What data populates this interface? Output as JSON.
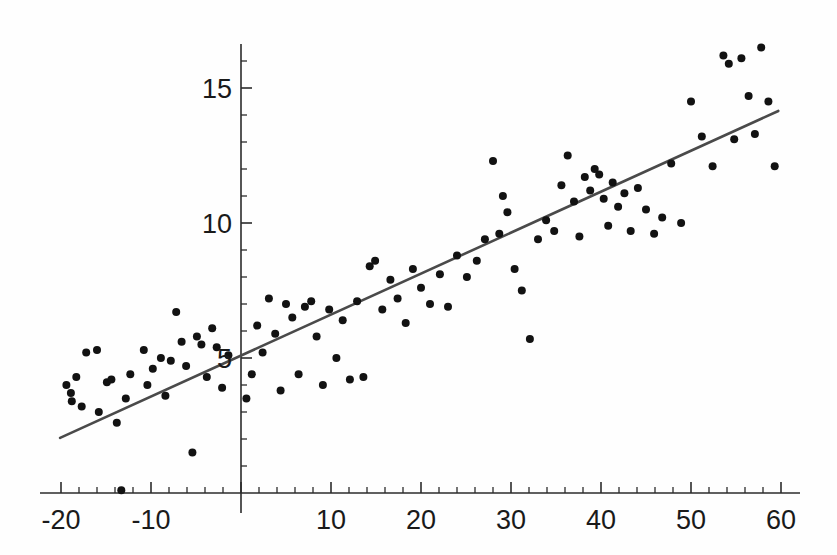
{
  "chart_data": {
    "type": "scatter",
    "title": "",
    "subtitle": "",
    "xlabel": "",
    "ylabel": "",
    "xlim": [
      -21,
      61
    ],
    "ylim": [
      0,
      16.8
    ],
    "grid": false,
    "legend": false,
    "legend_position": "none",
    "x_ticks_major": [
      -20,
      -10,
      0,
      10,
      20,
      30,
      40,
      50,
      60
    ],
    "x_tick_labels": [
      "-20",
      "-10",
      "",
      "10",
      "20",
      "30",
      "40",
      "50",
      "60"
    ],
    "x_tick_minor_step": 2,
    "y_ticks_major": [
      5,
      10,
      15
    ],
    "y_tick_labels": [
      "5",
      "10",
      "15"
    ],
    "y_tick_minor_step": 1,
    "axes_style": "crossed-spines-at-origin",
    "marker": "filled-circle",
    "marker_size_px": 8,
    "point_color": "#121212",
    "line_color": "#4a4a4a",
    "axis_color": "#2b2b2b",
    "background_color": "#fefefe",
    "series": [
      {
        "name": "observations",
        "x": [
          -19.4,
          -18.9,
          -18.8,
          -18.3,
          -17.7,
          -17.2,
          -16.0,
          -15.8,
          -14.9,
          -14.4,
          -13.8,
          -13.3,
          -12.8,
          -12.3,
          -10.8,
          -10.4,
          -9.8,
          -8.9,
          -8.4,
          -7.8,
          -7.2,
          -6.6,
          -6.1,
          -5.4,
          -4.9,
          -4.4,
          -3.8,
          -3.2,
          -2.7,
          -2.1,
          -1.4,
          0.6,
          1.2,
          1.8,
          2.4,
          3.1,
          3.8,
          4.4,
          5.0,
          5.7,
          6.4,
          7.1,
          7.8,
          8.4,
          9.1,
          9.8,
          10.6,
          11.3,
          12.1,
          12.9,
          13.6,
          14.3,
          14.9,
          15.7,
          16.6,
          17.4,
          18.3,
          19.1,
          20.0,
          21.0,
          22.1,
          23.0,
          24.0,
          25.1,
          26.2,
          27.1,
          28.0,
          28.7,
          29.1,
          29.6,
          30.4,
          31.2,
          32.1,
          33.0,
          33.9,
          34.8,
          35.6,
          36.3,
          37.0,
          37.6,
          38.2,
          38.8,
          39.3,
          39.8,
          40.3,
          40.8,
          41.3,
          41.9,
          42.6,
          43.3,
          44.1,
          45.0,
          45.9,
          46.8,
          47.8,
          48.9,
          50.0,
          51.2,
          52.4,
          53.6,
          54.2,
          54.8,
          55.6,
          56.4,
          57.1,
          57.8,
          58.6,
          59.3
        ],
        "y": [
          4.0,
          3.7,
          3.4,
          4.3,
          3.2,
          5.2,
          5.3,
          3.0,
          4.1,
          4.2,
          2.6,
          0.1,
          3.5,
          4.4,
          5.3,
          4.0,
          4.6,
          5.0,
          3.6,
          4.9,
          6.7,
          5.6,
          4.7,
          1.5,
          5.8,
          5.5,
          4.3,
          6.1,
          5.4,
          3.9,
          5.1,
          3.5,
          4.4,
          6.2,
          5.2,
          7.2,
          5.9,
          3.8,
          7.0,
          6.5,
          4.4,
          6.9,
          7.1,
          5.8,
          4.0,
          6.8,
          5.0,
          6.4,
          4.2,
          7.1,
          4.3,
          8.4,
          8.6,
          6.8,
          7.9,
          7.2,
          6.3,
          8.3,
          7.6,
          7.0,
          8.1,
          6.9,
          8.8,
          8.0,
          8.6,
          9.4,
          12.3,
          9.6,
          11.0,
          10.4,
          8.3,
          7.5,
          5.7,
          9.4,
          10.1,
          9.7,
          11.4,
          12.5,
          10.8,
          9.5,
          11.7,
          11.2,
          12.0,
          11.8,
          10.9,
          9.9,
          11.5,
          10.6,
          11.1,
          9.7,
          11.3,
          10.5,
          9.6,
          10.2,
          12.2,
          10.0,
          14.5,
          13.2,
          12.1,
          16.2,
          15.9,
          13.1,
          16.1,
          14.7,
          13.3,
          16.5,
          14.5,
          12.1
        ]
      }
    ],
    "fit_line": {
      "name": "least-squares-fit",
      "x_start": -20.1,
      "y_start": 2.04,
      "x_end": 59.7,
      "y_end": 14.15,
      "slope": 0.1517,
      "intercept": 5.09
    }
  },
  "axis": {
    "x_axis_name": "x-axis",
    "y_axis_name": "y-axis"
  }
}
